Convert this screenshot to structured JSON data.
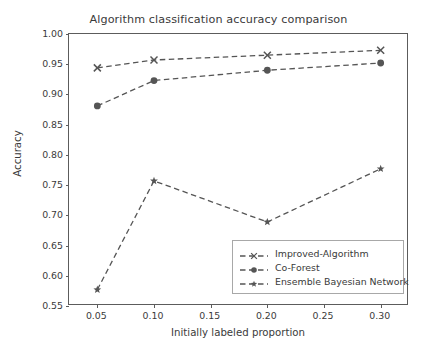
{
  "chart_data": {
    "type": "line",
    "title": "Algorithm classification accuracy comparison",
    "xlabel": "Initially labeled proportion",
    "ylabel": "Accuracy",
    "x": [
      0.05,
      0.1,
      0.2,
      0.3
    ],
    "xlim": [
      0.025,
      0.325
    ],
    "ylim": [
      0.55,
      1.0
    ],
    "xticks": [
      "0.05",
      "0.10",
      "0.15",
      "0.20",
      "0.25",
      "0.30"
    ],
    "xtick_values": [
      0.05,
      0.1,
      0.15,
      0.2,
      0.25,
      0.3
    ],
    "yticks": [
      "0.55",
      "0.60",
      "0.65",
      "0.70",
      "0.75",
      "0.80",
      "0.85",
      "0.90",
      "0.95",
      "1.00"
    ],
    "ytick_values": [
      0.55,
      0.6,
      0.65,
      0.7,
      0.75,
      0.8,
      0.85,
      0.9,
      0.95,
      1.0
    ],
    "grid": false,
    "legend_position": "lower right",
    "line_color": "#555555",
    "linestyle": "dashed",
    "series": [
      {
        "name": "Improved-Algorithm",
        "marker": "x",
        "values": [
          0.944,
          0.957,
          0.965,
          0.973
        ]
      },
      {
        "name": "Co-Forest",
        "marker": "o",
        "values": [
          0.881,
          0.923,
          0.94,
          0.952
        ]
      },
      {
        "name": "Ensemble Bayesian Network",
        "marker": "star",
        "values": [
          0.577,
          0.757,
          0.689,
          0.777
        ]
      }
    ]
  },
  "legend": {
    "items": [
      {
        "label": "Improved-Algorithm",
        "marker": "x-marker"
      },
      {
        "label": "Co-Forest",
        "marker": "circle-marker"
      },
      {
        "label": "Ensemble Bayesian Network",
        "marker": "star-marker"
      }
    ]
  }
}
